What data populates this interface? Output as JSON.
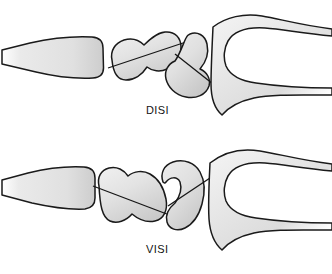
{
  "figure": {
    "background_color": "#ffffff",
    "outline_color": "#1a1a1a",
    "bone_fill_light": "#f2f2f2",
    "bone_fill_mid": "#dcdcdc",
    "bone_fill_dark": "#bfbfbf",
    "axis_line_color": "#161616"
  },
  "panels": [
    {
      "id": "disi",
      "label": "DISI",
      "label_position": {
        "x": 146,
        "y": 104
      },
      "description": "Dorsal intercalated segment instability",
      "bones": [
        {
          "name": "radius",
          "data_name": "bone-radius-disi",
          "has_axis_line": false
        },
        {
          "name": "scaphoid",
          "data_name": "bone-scaphoid-disi",
          "has_axis_line": true,
          "axis_orientation": "oblique-shallow"
        },
        {
          "name": "lunate",
          "data_name": "bone-lunate-disi",
          "has_axis_line": true,
          "axis_orientation": "dorsiflexed"
        },
        {
          "name": "capitate",
          "data_name": "bone-capitate-disi",
          "has_axis_line": false
        }
      ]
    },
    {
      "id": "visi",
      "label": "VISI",
      "label_position": {
        "x": 146,
        "y": 243
      },
      "description": "Volar intercalated segment instability",
      "bones": [
        {
          "name": "radius",
          "data_name": "bone-radius-visi",
          "has_axis_line": false
        },
        {
          "name": "scaphoid",
          "data_name": "bone-scaphoid-visi",
          "has_axis_line": true,
          "axis_orientation": "oblique-steep"
        },
        {
          "name": "lunate",
          "data_name": "bone-lunate-visi",
          "has_axis_line": true,
          "axis_orientation": "palmarflexed"
        },
        {
          "name": "capitate",
          "data_name": "bone-capitate-visi",
          "has_axis_line": false
        }
      ]
    }
  ]
}
